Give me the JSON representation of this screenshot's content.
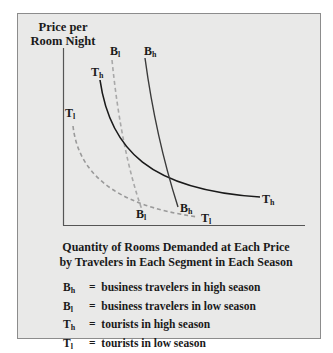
{
  "figure": {
    "y_axis_title": "Price per Room Night",
    "x_axis_caption_line1": "Quantity of Rooms Demanded at Each Price",
    "x_axis_caption_line2": "by Travelers in Each Segment in Each Season",
    "colors": {
      "panel_background": "#e9e9e8",
      "panel_border": "#8c8c8c",
      "solid_curve": "#1a1a1a",
      "dashed_curve": "#9a9a9a"
    }
  },
  "curves": [
    {
      "id": "Bh",
      "base": "B",
      "sub": "h",
      "style": "solid",
      "top_label": "B",
      "top_sub": "h",
      "bottom_label": "B",
      "bottom_sub": "h"
    },
    {
      "id": "Bl",
      "base": "B",
      "sub": "l",
      "style": "dashed",
      "top_label": "B",
      "top_sub": "l",
      "bottom_label": "B",
      "bottom_sub": "l"
    },
    {
      "id": "Th",
      "base": "T",
      "sub": "h",
      "style": "solid",
      "top_label": "T",
      "top_sub": "h",
      "bottom_label": "T",
      "bottom_sub": "h"
    },
    {
      "id": "Tl",
      "base": "T",
      "sub": "l",
      "style": "dashed",
      "top_label": "T",
      "top_sub": "l",
      "bottom_label": "T",
      "bottom_sub": "l"
    }
  ],
  "legend": [
    {
      "base": "B",
      "sub": "h",
      "eq": "=",
      "text": "business travelers in high season"
    },
    {
      "base": "B",
      "sub": "l",
      "eq": "=",
      "text": "business travelers in low season"
    },
    {
      "base": "T",
      "sub": "h",
      "eq": "=",
      "text": "tourists in high season"
    },
    {
      "base": "T",
      "sub": "l",
      "eq": "=",
      "text": "tourists  in low season"
    }
  ]
}
